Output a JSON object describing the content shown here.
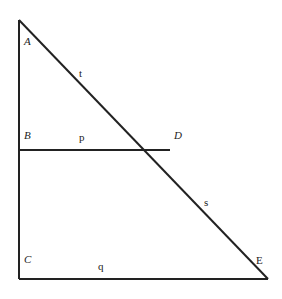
{
  "diagram": {
    "type": "geometry-triangle",
    "points": {
      "A": {
        "label": "A",
        "x": 19,
        "y": 20
      },
      "B": {
        "label": "B",
        "x": 19,
        "y": 150
      },
      "C": {
        "label": "C",
        "x": 19,
        "y": 279
      },
      "D": {
        "label": "D",
        "x": 170,
        "y": 150
      },
      "E": {
        "label": "E",
        "x": 268,
        "y": 279
      }
    },
    "segments": {
      "t": {
        "label": "t",
        "from": "A",
        "to": "D"
      },
      "p": {
        "label": "p",
        "from": "B",
        "to": "D"
      },
      "s": {
        "label": "s",
        "from": "D",
        "to": "E"
      },
      "q": {
        "label": "q",
        "from": "C",
        "to": "E"
      }
    },
    "line_color": "#222222"
  }
}
